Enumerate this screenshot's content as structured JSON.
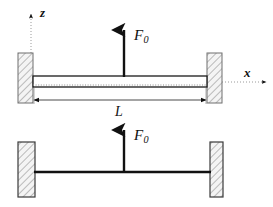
{
  "figure": {
    "background_color": "#ffffff",
    "line_color": "#111111",
    "hatch_color": "#8a8a8a",
    "support_fill": "#f2f2f2"
  },
  "axes": {
    "z_label": "z",
    "x_label": "x",
    "z_axis_name": "vertical-dotted-axis",
    "x_axis_name": "horizontal-dotted-axis"
  },
  "loads": {
    "top_force_symbol": "F",
    "top_force_subscript": "0",
    "bottom_force_symbol": "F",
    "bottom_force_subscript": "0"
  },
  "dimensions": {
    "span_label": "L"
  },
  "views": {
    "top_view_name": "beam-with-thickness-view",
    "bottom_view_name": "beam-line-model-view"
  },
  "supports": {
    "top_left_name": "fixed-support-top-left",
    "top_right_name": "fixed-support-top-right",
    "bottom_left_name": "fixed-support-bottom-left",
    "bottom_right_name": "fixed-support-bottom-right"
  }
}
